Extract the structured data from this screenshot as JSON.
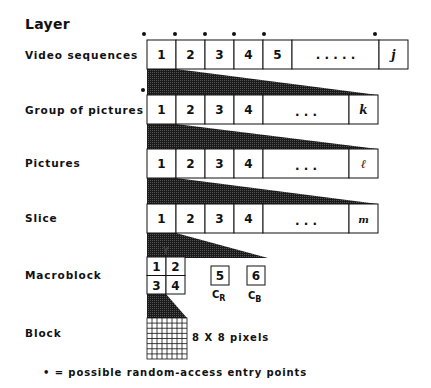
{
  "heading": "Layer",
  "rows": [
    {
      "label": "Video sequences",
      "cells": [
        "1",
        "2",
        "3",
        "4",
        "5"
      ],
      "ellipsis": ". . . . .",
      "last": "j"
    },
    {
      "label": "Group of pictures",
      "cells": [
        "1",
        "2",
        "3",
        "4"
      ],
      "ellipsis": ". . .",
      "last": "k"
    },
    {
      "label": "Pictures",
      "cells": [
        "1",
        "2",
        "3",
        "4"
      ],
      "ellipsis": ". . .",
      "last": "ℓ"
    },
    {
      "label": "Slice",
      "cells": [
        "1",
        "2",
        "3",
        "4"
      ],
      "ellipsis": ". . .",
      "last": "m"
    }
  ],
  "macroblock": {
    "label": "Macroblock",
    "luma_label": "Y",
    "luma_cells": [
      "1",
      "2",
      "3",
      "4"
    ],
    "chroma": [
      {
        "cell": "5",
        "name": "C",
        "sub": "R"
      },
      {
        "cell": "6",
        "name": "C",
        "sub": "B"
      }
    ]
  },
  "block": {
    "label": "Block",
    "size_label": "8 X 8 pixels",
    "grid": 8
  },
  "legend": "• = possible random-access entry points",
  "colors": {
    "ink": "#111111",
    "shade": "#222222",
    "background": "#ffffff"
  }
}
